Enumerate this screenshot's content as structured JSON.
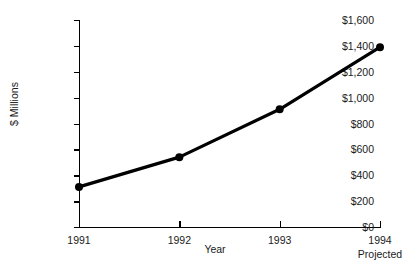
{
  "chart_data": {
    "type": "line",
    "title": "",
    "xlabel": "Year",
    "ylabel": "$ Millions",
    "categories": [
      "1991",
      "1992",
      "1993",
      "1994"
    ],
    "category_sublabels": [
      "",
      "",
      "",
      "Projected"
    ],
    "values": [
      310,
      540,
      910,
      1390
    ],
    "series": [
      {
        "name": "",
        "values": [
          310,
          540,
          910,
          1390
        ]
      }
    ],
    "ylim": [
      0,
      1600
    ],
    "y_ticks": [
      0,
      200,
      400,
      600,
      800,
      1000,
      1200,
      1400,
      1600
    ],
    "y_tick_labels": [
      "$0",
      "$200",
      "$400",
      "$600",
      "$800",
      "$1,000",
      "$1,200",
      "$1,400",
      "$1,600"
    ],
    "grid": false,
    "legend": "none",
    "line_color": "#000000",
    "marker": "circle",
    "marker_color": "#000000",
    "background_color": "#ffffff"
  }
}
